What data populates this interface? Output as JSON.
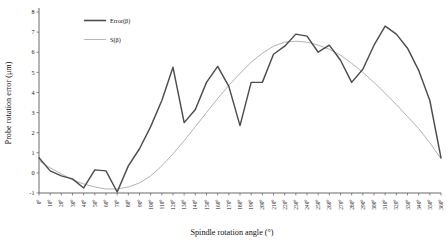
{
  "chart_data": {
    "type": "line",
    "title": "",
    "xlabel": "Spindle rotation angle (°)",
    "ylabel": "Probe rotation error (μm)",
    "xlim": [
      0,
      360
    ],
    "ylim": [
      -1,
      8
    ],
    "ytick_step": 1,
    "xtick_step": 10,
    "grid": false,
    "legend_position": "top-left-inside",
    "x": [
      0,
      10,
      20,
      30,
      40,
      50,
      60,
      70,
      80,
      90,
      100,
      110,
      120,
      130,
      140,
      150,
      160,
      170,
      180,
      190,
      200,
      210,
      220,
      230,
      240,
      250,
      260,
      270,
      280,
      290,
      300,
      310,
      320,
      330,
      340,
      350,
      360
    ],
    "xtick_labels": [
      "0°",
      "10°",
      "20°",
      "30°",
      "40°",
      "50°",
      "60°",
      "70°",
      "80°",
      "90°",
      "100°",
      "110°",
      "120°",
      "130°",
      "140°",
      "150°",
      "160°",
      "170°",
      "180°",
      "190°",
      "200°",
      "210°",
      "220°",
      "230°",
      "240°",
      "250°",
      "260°",
      "270°",
      "280°",
      "290°",
      "300°",
      "310°",
      "320°",
      "330°",
      "340°",
      "350°",
      "360°"
    ],
    "ytick_labels": [
      "-1",
      "0",
      "1",
      "2",
      "3",
      "4",
      "5",
      "6",
      "7",
      "8"
    ],
    "series": [
      {
        "name": "Error(β)",
        "color": "#4d4d4d",
        "width": 1.45,
        "values": [
          0.75,
          0.1,
          -0.15,
          -0.3,
          -0.75,
          0.15,
          0.1,
          -0.95,
          0.35,
          1.2,
          2.3,
          3.6,
          5.25,
          2.5,
          3.15,
          4.5,
          5.3,
          4.3,
          2.35,
          4.5,
          4.5,
          5.9,
          6.3,
          6.9,
          6.8,
          6.0,
          6.35,
          5.6,
          4.5,
          5.15,
          6.35,
          7.3,
          6.9,
          6.2,
          5.1,
          3.6,
          0.75
        ]
      },
      {
        "name": "S(β)",
        "color": "#b3b3b3",
        "width": 1.0,
        "values": [
          0.6,
          0.25,
          -0.05,
          -0.35,
          -0.55,
          -0.7,
          -0.8,
          -0.8,
          -0.7,
          -0.5,
          -0.15,
          0.35,
          0.95,
          1.6,
          2.3,
          3.0,
          3.7,
          4.35,
          4.95,
          5.5,
          5.95,
          6.3,
          6.5,
          6.55,
          6.5,
          6.35,
          6.15,
          5.85,
          5.45,
          5.0,
          4.5,
          3.95,
          3.4,
          2.8,
          2.2,
          1.5,
          0.7
        ]
      }
    ]
  },
  "legend": {
    "items": [
      {
        "label": "Error(β)",
        "color": "#4d4d4d"
      },
      {
        "label": "S(β)",
        "color": "#b3b3b3"
      }
    ]
  },
  "axes": {
    "x_title": "Spindle rotation angle (°)",
    "y_title": "Probe rotation error (μm)"
  }
}
